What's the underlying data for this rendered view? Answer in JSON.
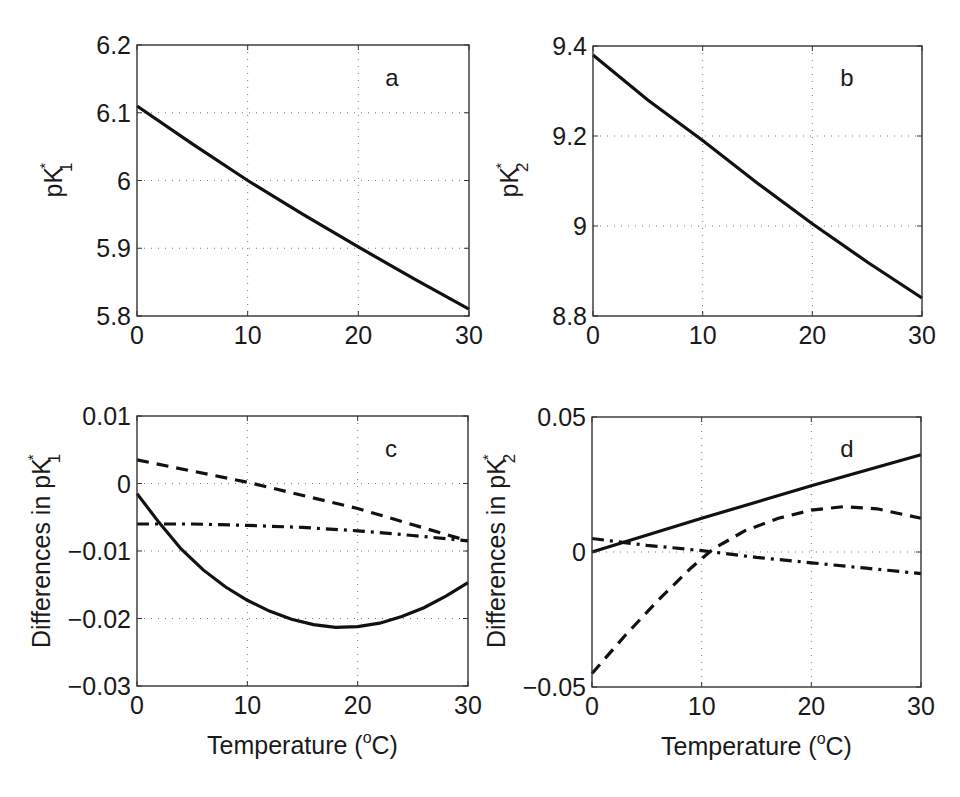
{
  "figure": {
    "panels": [
      {
        "letter": "a",
        "ylabel_main": "pK",
        "ylabel_sup": "*",
        "ylabel_sub": "1",
        "yticks": [
          "6.2",
          "6.1",
          "6",
          "5.9",
          "5.8"
        ],
        "xticks": [
          "0",
          "10",
          "20",
          "30"
        ]
      },
      {
        "letter": "b",
        "ylabel_main": "pK",
        "ylabel_sup": "*",
        "ylabel_sub": "2",
        "yticks": [
          "9.4",
          "9.2",
          "9",
          "8.8"
        ],
        "xticks": [
          "0",
          "10",
          "20",
          "30"
        ]
      },
      {
        "letter": "c",
        "ylabel_main": "Differences in pK",
        "ylabel_sup": "*",
        "ylabel_sub": "1",
        "yticks": [
          "0.01",
          "0",
          "−0.01",
          "−0.02",
          "−0.03"
        ],
        "xticks": [
          "0",
          "10",
          "20",
          "30"
        ],
        "xlabel_main": "Temperature (",
        "xlabel_sup": "o",
        "xlabel_end": "C)"
      },
      {
        "letter": "d",
        "ylabel_main": "Differences in pK",
        "ylabel_sup": "*",
        "ylabel_sub": "2",
        "yticks": [
          "0.05",
          "0",
          "−0.05"
        ],
        "xticks": [
          "0",
          "10",
          "20",
          "30"
        ],
        "xlabel_main": "Temperature (",
        "xlabel_sup": "o",
        "xlabel_end": "C)"
      }
    ]
  },
  "chart_data": [
    {
      "type": "line",
      "panel": "a",
      "title": "",
      "xlabel": "",
      "ylabel": "pK*1",
      "xlim": [
        0,
        30
      ],
      "ylim": [
        5.8,
        6.2
      ],
      "grid": true,
      "xticks": [
        0,
        10,
        20,
        30
      ],
      "yticks": [
        5.8,
        5.9,
        6.0,
        6.1,
        6.2
      ],
      "series": [
        {
          "name": "pK*1",
          "style": "solid",
          "x": [
            0,
            5,
            10,
            15,
            20,
            25,
            30
          ],
          "y": [
            6.11,
            6.054,
            6.0,
            5.95,
            5.902,
            5.855,
            5.81
          ]
        }
      ]
    },
    {
      "type": "line",
      "panel": "b",
      "title": "",
      "xlabel": "",
      "ylabel": "pK*2",
      "xlim": [
        0,
        30
      ],
      "ylim": [
        8.8,
        9.4
      ],
      "grid": true,
      "xticks": [
        0,
        10,
        20,
        30
      ],
      "yticks": [
        8.8,
        9.0,
        9.2,
        9.4
      ],
      "series": [
        {
          "name": "pK*2",
          "style": "solid",
          "x": [
            0,
            5,
            10,
            15,
            20,
            25,
            30
          ],
          "y": [
            9.38,
            9.28,
            9.19,
            9.095,
            9.005,
            8.92,
            8.84
          ]
        }
      ]
    },
    {
      "type": "line",
      "panel": "c",
      "title": "",
      "xlabel": "Temperature (oC)",
      "ylabel": "Differences in pK*1",
      "xlim": [
        0,
        30
      ],
      "ylim": [
        -0.03,
        0.01
      ],
      "grid": true,
      "xticks": [
        0,
        10,
        20,
        30
      ],
      "yticks": [
        -0.03,
        -0.02,
        -0.01,
        0,
        0.01
      ],
      "series": [
        {
          "name": "solid",
          "style": "solid",
          "x": [
            0,
            2,
            4,
            6,
            8,
            10,
            12,
            14,
            16,
            18,
            20,
            22,
            24,
            26,
            28,
            30
          ],
          "y": [
            -0.0015,
            -0.0058,
            -0.0097,
            -0.0128,
            -0.0153,
            -0.0173,
            -0.0189,
            -0.0201,
            -0.0209,
            -0.0213,
            -0.0212,
            -0.0207,
            -0.0197,
            -0.0184,
            -0.0167,
            -0.0147
          ]
        },
        {
          "name": "dashed",
          "style": "dashed",
          "x": [
            0,
            10,
            20,
            30
          ],
          "y": [
            0.0035,
            0.0002,
            -0.0037,
            -0.0085
          ]
        },
        {
          "name": "dash-dot",
          "style": "dashdot",
          "x": [
            0,
            5,
            10,
            15,
            20,
            25,
            30
          ],
          "y": [
            -0.006,
            -0.006,
            -0.0062,
            -0.0065,
            -0.007,
            -0.0077,
            -0.0085
          ]
        }
      ]
    },
    {
      "type": "line",
      "panel": "d",
      "title": "",
      "xlabel": "Temperature (oC)",
      "ylabel": "Differences in pK*2",
      "xlim": [
        0,
        30
      ],
      "ylim": [
        -0.05,
        0.05
      ],
      "grid": true,
      "xticks": [
        0,
        10,
        20,
        30
      ],
      "yticks": [
        -0.05,
        0,
        0.05
      ],
      "series": [
        {
          "name": "solid",
          "style": "solid",
          "x": [
            0,
            10,
            20,
            30
          ],
          "y": [
            0.0,
            0.0125,
            0.0245,
            0.036
          ]
        },
        {
          "name": "dashed",
          "style": "dashed",
          "x": [
            0,
            3,
            6,
            9,
            11,
            14,
            17,
            20,
            23,
            26,
            30
          ],
          "y": [
            -0.045,
            -0.031,
            -0.018,
            -0.006,
            0.001,
            0.008,
            0.0125,
            0.0155,
            0.0168,
            0.016,
            0.0125
          ]
        },
        {
          "name": "dash-dot",
          "style": "dashdot",
          "x": [
            0,
            5,
            10,
            15,
            20,
            25,
            30
          ],
          "y": [
            0.005,
            0.0025,
            0.0005,
            -0.002,
            -0.004,
            -0.006,
            -0.008
          ]
        }
      ]
    }
  ]
}
